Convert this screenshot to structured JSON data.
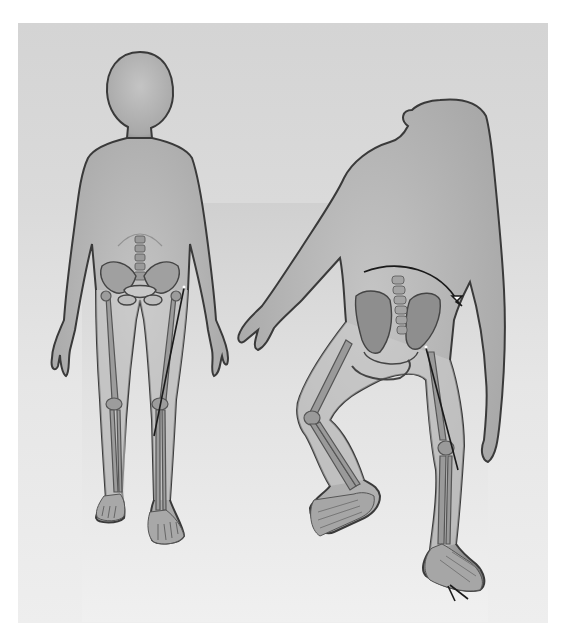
{
  "figure": {
    "subjects": [
      {
        "id": "human",
        "label": "",
        "posture": "upright bipedal",
        "position": "left"
      },
      {
        "id": "chimpanzee",
        "label": "",
        "posture": "bent-knee quadrupedal stance",
        "position": "right"
      }
    ],
    "annotations": [
      {
        "name": "human-femur-line",
        "type": "line",
        "subject": "human"
      },
      {
        "name": "chimp-pelvis-rotation-arrow",
        "type": "curved-arrow",
        "subject": "chimpanzee"
      },
      {
        "name": "chimp-femur-line",
        "type": "line",
        "subject": "chimpanzee"
      },
      {
        "name": "chimp-big-toe-angle-marker",
        "type": "angle",
        "subject": "chimpanzee"
      }
    ],
    "colors": {
      "background": "#ffffff",
      "frame": "#d8d8d8",
      "inner_panel": "#e4e4e4",
      "body_fill": "#b4b4b4",
      "body_outline": "#3a3a3a",
      "bone": "#8a8a8a",
      "annotation": "#1a1a1a"
    }
  }
}
